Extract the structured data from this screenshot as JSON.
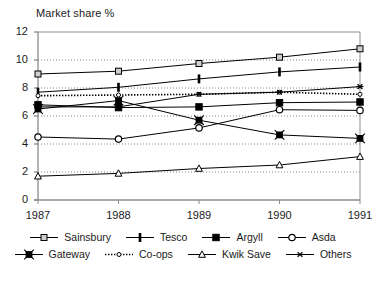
{
  "chart_data": {
    "type": "line",
    "title": "Market share %",
    "xlabel": "",
    "ylabel": "Market share %",
    "x": [
      1987,
      1988,
      1989,
      1990,
      1991
    ],
    "categories": [
      "1987",
      "1988",
      "1989",
      "1990",
      "1991"
    ],
    "xtick_labels": [
      "1987",
      "1988",
      "1989",
      "1990",
      "1991"
    ],
    "ytick_labels": [
      "0",
      "2",
      "4",
      "6",
      "8",
      "10",
      "12"
    ],
    "yticks": [
      0,
      2,
      4,
      6,
      8,
      10,
      12
    ],
    "ylim": [
      0,
      12
    ],
    "xlim": [
      1987,
      1991
    ],
    "grid": "horizontal-dotted",
    "legend_position": "bottom",
    "series": [
      {
        "name": "Sainsbury",
        "marker": "square-open",
        "line": "solid",
        "values": [
          9.0,
          9.2,
          9.75,
          10.2,
          10.8
        ]
      },
      {
        "name": "Tesco",
        "marker": "bar-vertical",
        "line": "solid",
        "values": [
          7.7,
          8.05,
          8.65,
          9.15,
          9.5
        ]
      },
      {
        "name": "Argyll",
        "marker": "square-filled",
        "line": "solid",
        "values": [
          6.8,
          6.6,
          6.65,
          6.95,
          7.0
        ]
      },
      {
        "name": "Asda",
        "marker": "circle-open",
        "line": "solid",
        "values": [
          4.5,
          4.35,
          5.15,
          6.45,
          6.4
        ]
      },
      {
        "name": "Gateway",
        "marker": "square-x",
        "line": "solid",
        "values": [
          6.5,
          7.1,
          5.7,
          4.65,
          4.4
        ]
      },
      {
        "name": "Co-ops",
        "marker": "circle-small",
        "line": "dotted",
        "values": [
          7.45,
          7.5,
          7.55,
          7.7,
          7.55
        ]
      },
      {
        "name": "Kwik Save",
        "marker": "triangle-open",
        "line": "solid",
        "values": [
          1.7,
          1.9,
          2.25,
          2.5,
          3.1
        ]
      },
      {
        "name": "Others",
        "marker": "asterisk",
        "line": "solid",
        "values": [
          6.65,
          6.65,
          7.55,
          7.7,
          8.1
        ]
      }
    ]
  },
  "legend": {
    "rows": [
      [
        "Sainsbury",
        "Tesco",
        "Argyll",
        "Asda"
      ],
      [
        "Gateway",
        "Co-ops",
        "Kwik Save",
        "Others"
      ]
    ]
  },
  "colors": {
    "line": "#000000",
    "axis": "#8c8c8c",
    "grid": "#8c8c8c",
    "text": "#1a1a1a",
    "background": "#ffffff"
  }
}
